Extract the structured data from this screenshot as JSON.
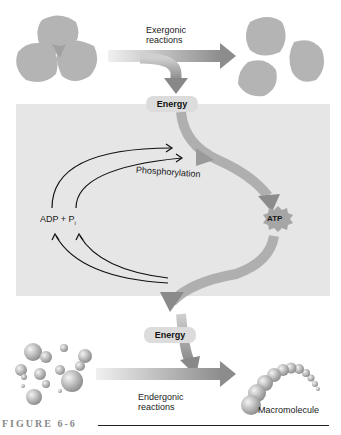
{
  "diagram": {
    "top": {
      "reaction_label_line1": "Exergonic",
      "reaction_label_line2": "reactions",
      "energy_label": "Energy"
    },
    "cycle": {
      "left_label_adp": "ADP + P",
      "left_label_sub": "i",
      "process_label": "Phosphorylation",
      "right_label": "ATP"
    },
    "bottom": {
      "energy_label": "Energy",
      "reaction_label_line1": "Endergonic",
      "reaction_label_line2": "reactions",
      "product_label": "Macromolecule"
    },
    "caption": "FIGURE 6-6",
    "colors": {
      "panel": "#e6e6e6",
      "arrow": "#9a9a9a",
      "blob": "#b0b0b0",
      "atp_star": "#a8a8a8"
    }
  }
}
